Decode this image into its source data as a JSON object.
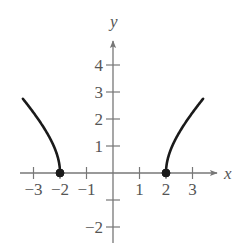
{
  "chart_data": {
    "type": "line",
    "title": "",
    "xlabel": "x",
    "ylabel": "y",
    "xlim": [
      -3.6,
      3.9
    ],
    "ylim": [
      -2.6,
      4.9
    ],
    "grid": false,
    "x_ticks": [
      -3,
      -2,
      -1,
      1,
      2,
      3
    ],
    "x_tick_labels": [
      "−3",
      "−2",
      "−1",
      "1",
      "2",
      "3"
    ],
    "y_ticks": [
      -2,
      -1,
      1,
      2,
      3,
      4
    ],
    "y_tick_labels": [
      "−2",
      "",
      "1",
      "2",
      "3",
      "4"
    ],
    "series": [
      {
        "name": "left-branch",
        "function": "y = sqrt(x^2 - 4)",
        "x": [
          -3.4,
          -3.2,
          -3.0,
          -2.8,
          -2.6,
          -2.4,
          -2.2,
          -2.1,
          -2.05,
          -2.0
        ],
        "values": [
          2.75,
          2.5,
          2.24,
          1.96,
          1.66,
          1.33,
          0.92,
          0.64,
          0.45,
          0.0
        ]
      },
      {
        "name": "right-branch",
        "function": "y = sqrt(x^2 - 4)",
        "x": [
          2.0,
          2.05,
          2.1,
          2.2,
          2.4,
          2.6,
          2.8,
          3.0,
          3.2,
          3.4
        ],
        "values": [
          0.0,
          0.45,
          0.64,
          0.92,
          1.33,
          1.66,
          1.96,
          2.24,
          2.5,
          2.75
        ]
      }
    ],
    "points": [
      {
        "x": -2,
        "y": 0,
        "style": "closed"
      },
      {
        "x": 2,
        "y": 0,
        "style": "closed"
      }
    ],
    "colors": {
      "axis": "#777777",
      "curve": "#1a1a1a",
      "text": "#555555"
    }
  }
}
